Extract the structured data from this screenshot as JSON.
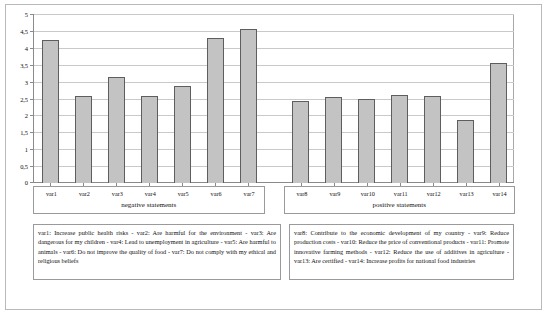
{
  "chart_data": {
    "type": "bar",
    "title": "",
    "xlabel": "",
    "ylabel": "",
    "ylim": [
      0,
      5
    ],
    "grid": true,
    "legend_position": "below-axis",
    "yticks": [
      "0",
      "0,5",
      "1",
      "1,5",
      "2",
      "2,5",
      "3",
      "3,5",
      "4",
      "4,5",
      "5"
    ],
    "ytick_values": [
      0,
      0.5,
      1,
      1.5,
      2,
      2.5,
      3,
      3.5,
      4,
      4.5,
      5
    ],
    "categories": [
      "var1",
      "var2",
      "var3",
      "var4",
      "var5",
      "var6",
      "var7",
      "var8",
      "var9",
      "var10",
      "var11",
      "var12",
      "var13",
      "var14"
    ],
    "values": [
      4.22,
      2.57,
      3.14,
      2.58,
      2.88,
      4.3,
      4.56,
      2.43,
      2.55,
      2.48,
      2.6,
      2.57,
      1.87,
      3.55
    ],
    "groups": [
      {
        "title": "negative statements",
        "categories": [
          "var1",
          "var2",
          "var3",
          "var4",
          "var5",
          "var6",
          "var7"
        ]
      },
      {
        "title": "positive statements",
        "categories": [
          "var8",
          "var9",
          "var10",
          "var11",
          "var12",
          "var13",
          "var14"
        ]
      }
    ],
    "bar_color": "#c3c3c3",
    "bar_border_color": "#5e5e5e"
  },
  "legend": {
    "negative": "var1: Increase public health risks - var2: Are harmful for the environment - var3: Are dangerous for my children - var4: Lead to unemployment in agriculture - var5: Are harmful to animals - var6: Do not improve the quality of food - var7: Do not comply with my ethical and religious beliefs",
    "positive": "var8: Contribute to the economic development of my country - var9: Reduce production costs - var10: Reduce the price of conventional products - var11: Promote innovative farming methods - var12: Reduce the use of additives in agriculture - var13: Are certified - var14: Increase profits for national food industries"
  }
}
